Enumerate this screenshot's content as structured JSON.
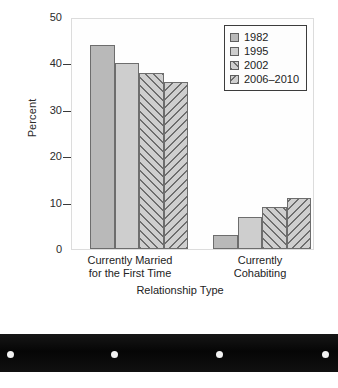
{
  "chart_data": {
    "type": "bar",
    "title": "",
    "xlabel": "Relationship Type",
    "ylabel": "Percent",
    "ylim": [
      0,
      50
    ],
    "yticks": [
      0,
      10,
      20,
      30,
      40,
      50
    ],
    "grid": false,
    "legend_position": "top-right inside plot",
    "categories": [
      "Currently Married for the First Time",
      "Currently Cohabiting"
    ],
    "category_lines": [
      [
        "Currently Married",
        "for the First Time"
      ],
      [
        "Currently",
        "Cohabiting"
      ]
    ],
    "series": [
      {
        "name": "1982",
        "values": [
          44,
          3
        ],
        "fill": "solid-dark",
        "color": "#b9b9b9"
      },
      {
        "name": "1995",
        "values": [
          40,
          7
        ],
        "fill": "solid-light",
        "color": "#cecece"
      },
      {
        "name": "2002",
        "values": [
          38,
          9
        ],
        "fill": "hatch-fwd",
        "color": "#cfcfcf"
      },
      {
        "name": "2006–2010",
        "values": [
          36,
          11
        ],
        "fill": "hatch-back",
        "color": "#cfcfcf"
      }
    ]
  },
  "axis": {
    "y_tick_labels": [
      "50",
      "40",
      "30",
      "20",
      "10",
      "0"
    ],
    "y_title": "Percent",
    "x_title": "Relationship Type"
  },
  "legend": {
    "entries": [
      {
        "label": "1982"
      },
      {
        "label": "1995"
      },
      {
        "label": "2002"
      },
      {
        "label": "2006–2010"
      }
    ]
  },
  "categories_display": {
    "group0_line1": "Currently Married",
    "group0_line2": "for the First Time",
    "group1_line1": "Currently",
    "group1_line2": "Cohabiting"
  },
  "artifact": {
    "name": "scanned-page-edge-band",
    "dot_count": 4
  }
}
